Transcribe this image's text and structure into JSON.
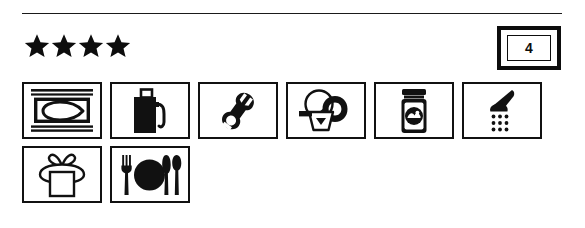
{
  "document": {
    "type": "accommodation-amenity-listing",
    "ink_color": "#0d0d0d",
    "paper_color": "#ffffff"
  },
  "divider": {
    "name": "top-horizontal-rule"
  },
  "rating": {
    "label": "Star rating",
    "stars_filled": 4,
    "stars": [
      "star",
      "star",
      "star",
      "star"
    ],
    "symbol": "★"
  },
  "category_badge": {
    "name": "category-number-badge",
    "value": "4"
  },
  "amenities": {
    "rows": [
      {
        "items": [
          {
            "icon": "ironing-board-icon",
            "label": "Ironing / laundry pressing service"
          },
          {
            "icon": "fuel-pump-icon",
            "label": "Fuel / petrol station"
          },
          {
            "icon": "wrench-icon",
            "label": "Repair / maintenance service"
          },
          {
            "icon": "laundry-basket-icon",
            "label": "Laundry service"
          },
          {
            "icon": "preserves-jar-icon",
            "label": "Local produce / preserves"
          },
          {
            "icon": "shower-icon",
            "label": "Shower facilities"
          }
        ]
      },
      {
        "items": [
          {
            "icon": "gift-package-icon",
            "label": "Gift shop / souvenirs"
          },
          {
            "icon": "dining-place-setting-icon",
            "label": "Restaurant / dining"
          }
        ]
      }
    ]
  }
}
